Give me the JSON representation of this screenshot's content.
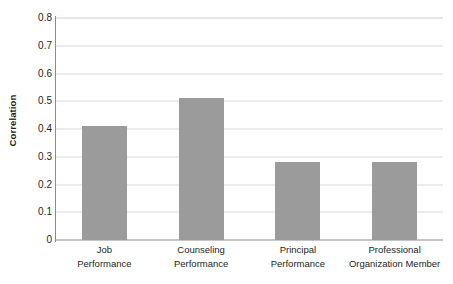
{
  "chart_data": {
    "type": "bar",
    "title": "",
    "subtitle": "",
    "xlabel": "",
    "ylabel": "Correlation",
    "categories": [
      "Job Performance",
      "Counseling Performance",
      "Principal Performance",
      "Professional Organization Member"
    ],
    "category_lines": [
      [
        "Job",
        "Performance"
      ],
      [
        "Counseling",
        "Performance"
      ],
      [
        "Principal",
        "Performance"
      ],
      [
        "Professional",
        "Organization Member"
      ]
    ],
    "values": [
      0.41,
      0.51,
      0.28,
      0.28
    ],
    "ylim": [
      0,
      0.8
    ],
    "ytick_values": [
      0,
      0.1,
      0.2,
      0.3,
      0.4,
      0.5,
      0.6,
      0.7,
      0.8
    ],
    "ytick_labels": [
      "0",
      "0.1",
      "0.2",
      "0.3",
      "0.4",
      "0.5",
      "0.6",
      "0.7",
      "0.8"
    ],
    "grid": "horizontal",
    "legend": "none",
    "bar_color": "#9b9b9b",
    "gridline_color": "#d8d8d8",
    "axis_color": "#8c8c8c",
    "text_color": "#231f20"
  }
}
